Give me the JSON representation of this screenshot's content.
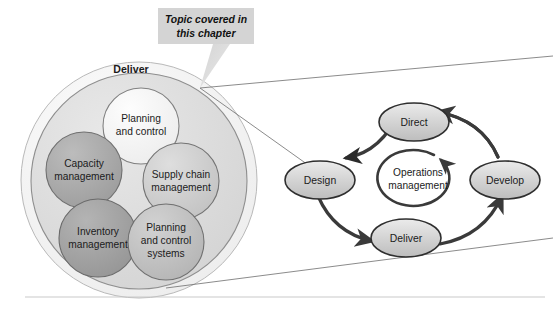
{
  "figure": {
    "callout": {
      "line1": "Topic covered in",
      "line2": "this chapter",
      "bg_color": "#d4d4d4"
    },
    "left_group": {
      "title": "Deliver",
      "outer_ring_color": "#f2f2f2",
      "inner_disc_color": "#dedede",
      "bubbles": [
        {
          "id": "planning-and-control",
          "line1": "Planning",
          "line2": "and control",
          "fill": "#f4f4f4"
        },
        {
          "id": "capacity-management",
          "line1": "Capacity",
          "line2": "management",
          "fill": "#a8a8a8"
        },
        {
          "id": "supply-chain-management",
          "line1": "Supply chain",
          "line2": "management",
          "fill": "#cfcfcf"
        },
        {
          "id": "inventory-management",
          "line1": "Inventory",
          "line2": "management",
          "fill": "#a0a0a0"
        },
        {
          "id": "planning-and-control-systems",
          "line1": "Planning",
          "line2": "and control",
          "line3": "systems",
          "fill": "#bfbfbf"
        }
      ]
    },
    "cycle": {
      "center_line1": "Operations",
      "center_line2": "management",
      "nodes": [
        {
          "id": "direct",
          "label": "Direct"
        },
        {
          "id": "develop",
          "label": "Develop"
        },
        {
          "id": "deliver",
          "label": "Deliver"
        },
        {
          "id": "design",
          "label": "Design"
        }
      ],
      "node_fill": "#d2d2d2",
      "arrow_color": "#3a3a3a"
    },
    "rule_color": "#c9c9c9"
  }
}
